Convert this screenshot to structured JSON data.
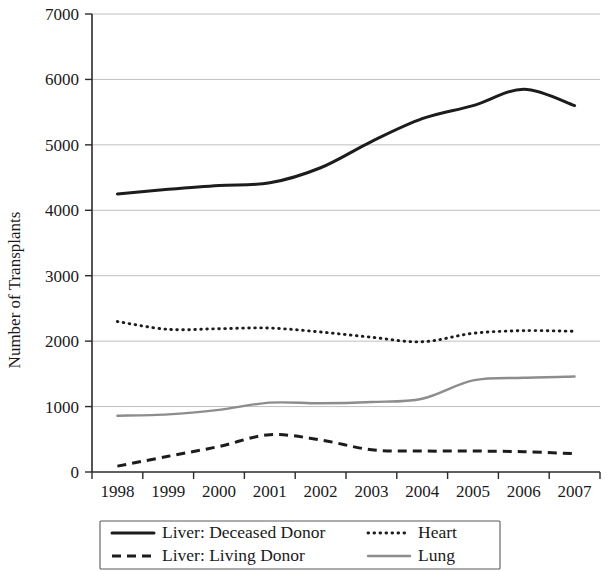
{
  "chart_data": {
    "type": "line",
    "title": "",
    "xlabel": "",
    "ylabel": "Number of Transplants",
    "categories": [
      "1998",
      "1999",
      "2000",
      "2001",
      "2002",
      "2003",
      "2004",
      "2005",
      "2006",
      "2007"
    ],
    "ylim": [
      0,
      7000
    ],
    "yticks": [
      "0",
      "1000",
      "2000",
      "3000",
      "4000",
      "5000",
      "6000",
      "7000"
    ],
    "ytick_values": [
      0,
      1000,
      2000,
      3000,
      4000,
      5000,
      6000,
      7000
    ],
    "grid": true,
    "legend_position": "bottom",
    "series": [
      {
        "name": "Liver: Deceased Donor",
        "style": "solid",
        "color": "#1c1c1c",
        "values": [
          4250,
          4320,
          4380,
          4420,
          4650,
          5050,
          5400,
          5600,
          5850,
          5600
        ]
      },
      {
        "name": "Liver: Living Donor",
        "style": "dashed",
        "color": "#1c1c1c",
        "values": [
          90,
          240,
          390,
          570,
          490,
          340,
          320,
          320,
          310,
          280
        ]
      },
      {
        "name": "Heart",
        "style": "dotted",
        "color": "#1c1c1c",
        "values": [
          2300,
          2180,
          2190,
          2200,
          2140,
          2060,
          1990,
          2120,
          2160,
          2150
        ]
      },
      {
        "name": "Lung",
        "style": "solid",
        "color": "#8d8d8d",
        "values": [
          860,
          880,
          950,
          1060,
          1050,
          1070,
          1120,
          1400,
          1440,
          1460
        ]
      }
    ]
  },
  "legend": {
    "entries": [
      {
        "label": "Liver: Deceased Donor",
        "key": "solid-dark-line-key"
      },
      {
        "label": "Heart",
        "key": "dotted-dark-line-key"
      },
      {
        "label": "Liver: Living Donor",
        "key": "dashed-dark-line-key"
      },
      {
        "label": "Lung",
        "key": "solid-gray-line-key"
      }
    ]
  }
}
